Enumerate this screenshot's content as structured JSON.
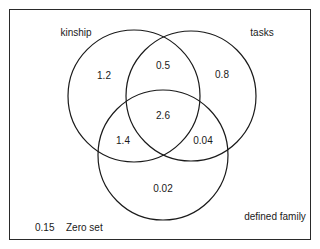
{
  "diagram": {
    "type": "venn-3",
    "sets": [
      {
        "name": "kinship",
        "label": "kinship"
      },
      {
        "name": "tasks",
        "label": "tasks"
      },
      {
        "name": "defined-family",
        "label": "defined family"
      }
    ],
    "regions": {
      "kinship_only": "1.2",
      "tasks_only": "0.8",
      "defined_family_only": "0.02",
      "kinship_tasks": "0.5",
      "kinship_defined_family": "1.4",
      "tasks_defined_family": "0.04",
      "all_three": "2.6"
    },
    "zero_set": {
      "value": "0.15",
      "label": "Zero set"
    },
    "stroke_color": "#1a1a1a"
  }
}
